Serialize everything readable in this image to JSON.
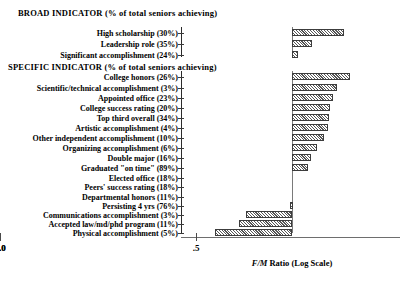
{
  "headers": {
    "broad": "BROAD INDICATOR    (% of total seniors achieving)",
    "specific": "SPECIFIC INDICATOR (% of total seniors achieving)"
  },
  "axis": {
    "title_italic": "F/M",
    "title_rest": " Ratio (Log Scale)",
    "ticks": [
      {
        "label": ".5",
        "value": 0.5
      },
      {
        "label": "1.0",
        "value": 1.0
      },
      {
        "label": "2.0",
        "value": 2.0
      }
    ]
  },
  "chart_data": {
    "type": "bar",
    "title": "",
    "subtitle": "",
    "xlabel": "F/M Ratio (Log Scale)",
    "ylabel": "",
    "orientation": "horizontal",
    "xscale": "log",
    "xlim": [
      0.45,
      2.2
    ],
    "baseline": 1.0,
    "grid": false,
    "legend": false,
    "tick_labels": [
      ".5",
      "1.0",
      "2.0"
    ],
    "tick_values": [
      0.5,
      1.0,
      2.0
    ],
    "groups": [
      {
        "name": "BROAD INDICATOR    (% of total seniors achieving)",
        "categories": [
          "High scholarship (30%)",
          "Leadership role (35%)",
          "Significant accomplishment (24%)"
        ],
        "values": [
          1.46,
          1.16,
          1.04
        ]
      },
      {
        "name": "SPECIFIC INDICATOR (% of total seniors achieving)",
        "categories": [
          "College honors (26%)",
          "Scientific/technical accomplishment (3%)",
          "Appointed office (23%)",
          "College success rating (20%)",
          "Top third overall (34%)",
          "Artistic accomplishment (4%)",
          "Other independent accomplishment (10%)",
          "Organizing accomplishment (6%)",
          "Double major (16%)",
          "Graduated \"on time\" (89%)",
          "Elected office (18%)",
          "Peers' success rating (18%)",
          "Departmental honors (11%)",
          "Persisting 4 yrs (76%)",
          "Communications accomplishment (3%)",
          "Accepted law/md/phd program (11%)",
          "Physical accomplishment (5%)"
        ],
        "values": [
          1.57,
          1.43,
          1.38,
          1.35,
          1.34,
          1.33,
          1.3,
          1.22,
          1.16,
          1.14,
          1.0,
          1.0,
          1.0,
          1.0,
          0.81,
          0.78,
          0.68
        ]
      }
    ]
  },
  "rows": [
    {
      "label": "High scholarship (30%)",
      "bar_left": 292,
      "bar_width": 52,
      "group": "broad"
    },
    {
      "label": "Leadership role (35%)",
      "bar_left": 292,
      "bar_width": 20,
      "group": "broad"
    },
    {
      "label": "Significant accomplishment (24%)",
      "bar_left": 292,
      "bar_width": 6,
      "group": "broad"
    },
    {
      "label": "College honors (26%)",
      "bar_left": 292,
      "bar_width": 58,
      "group": "specific"
    },
    {
      "label": "Scientific/technical accomplishment (3%)",
      "bar_left": 292,
      "bar_width": 45,
      "group": "specific"
    },
    {
      "label": "Appointed office (23%)",
      "bar_left": 292,
      "bar_width": 41,
      "group": "specific"
    },
    {
      "label": "College success rating (20%)",
      "bar_left": 292,
      "bar_width": 38,
      "group": "specific"
    },
    {
      "label": "Top third overall (34%)",
      "bar_left": 292,
      "bar_width": 37,
      "group": "specific"
    },
    {
      "label": "Artistic accomplishment (4%)",
      "bar_left": 292,
      "bar_width": 36,
      "group": "specific"
    },
    {
      "label": "Other independent accomplishment (10%)",
      "bar_left": 292,
      "bar_width": 32,
      "group": "specific"
    },
    {
      "label": "Organizing accomplishment (6%)",
      "bar_left": 292,
      "bar_width": 25,
      "group": "specific"
    },
    {
      "label": "Double major (16%)",
      "bar_left": 292,
      "bar_width": 19,
      "group": "specific"
    },
    {
      "label": "Graduated \"on time\" (89%)",
      "bar_left": 292,
      "bar_width": 16,
      "group": "specific"
    },
    {
      "label": "Elected office (18%)",
      "bar_left": 292,
      "bar_width": 0,
      "group": "specific"
    },
    {
      "label": "Peers' success rating (18%)",
      "bar_left": 292,
      "bar_width": 0,
      "group": "specific"
    },
    {
      "label": "Departmental honors (11%)",
      "bar_left": 292,
      "bar_width": 0,
      "group": "specific"
    },
    {
      "label": "Persisting 4 yrs (76%)",
      "bar_left": 290,
      "bar_width": 3,
      "group": "specific"
    },
    {
      "label": "Communications accomplishment (3%)",
      "bar_left": 246,
      "bar_width": 46,
      "group": "specific"
    },
    {
      "label": "Accepted law/md/phd program (11%)",
      "bar_left": 239,
      "bar_width": 53,
      "group": "specific"
    },
    {
      "label": "Physical accomplishment (5%)",
      "bar_left": 215,
      "bar_width": 77,
      "group": "specific"
    }
  ],
  "layout": {
    "row_tops": [
      28,
      39,
      50,
      72,
      83,
      93,
      103,
      113,
      123,
      133,
      143,
      153,
      163,
      173,
      182,
      192,
      201,
      210,
      219,
      228
    ],
    "tick_x": {
      "0.5": 196,
      "1.0": 292,
      "2.0": 383
    }
  }
}
